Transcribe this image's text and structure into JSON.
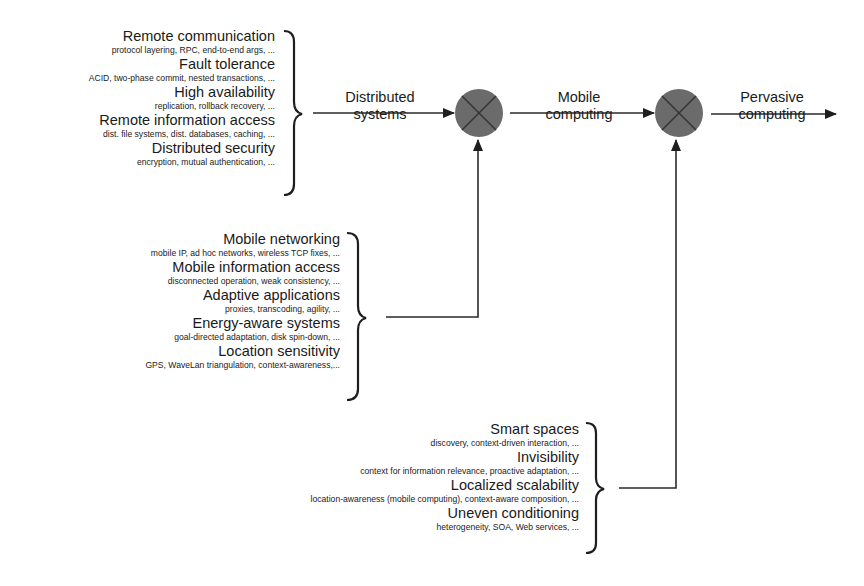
{
  "diagram": {
    "colors": {
      "line": "#2a2a2a",
      "node_fill": "#6b6b6b",
      "node_cross": "#333333",
      "text": "#1a1a1a"
    },
    "groups": [
      {
        "id": "distributed",
        "items": [
          {
            "title": "Remote communication",
            "detail": "protocol layering, RPC, end-to-end args, ..."
          },
          {
            "title": "Fault tolerance",
            "detail": "ACID, two-phase commit, nested transactions, ..."
          },
          {
            "title": "High availability",
            "detail": "replication, rollback recovery, ..."
          },
          {
            "title": "Remote information access",
            "detail": "dist. file systems, dist. databases, caching, ..."
          },
          {
            "title": "Distributed security",
            "detail": "encryption, mutual authentication, ..."
          }
        ]
      },
      {
        "id": "mobile",
        "items": [
          {
            "title": "Mobile networking",
            "detail": "mobile IP, ad hoc networks, wireless TCP fixes, ..."
          },
          {
            "title": "Mobile information access",
            "detail": "disconnected operation, weak consistency, ..."
          },
          {
            "title": "Adaptive applications",
            "detail": "proxies, transcoding, agility, ..."
          },
          {
            "title": "Energy-aware systems",
            "detail": "goal-directed adaptation, disk spin-down, ..."
          },
          {
            "title": "Location sensitivity",
            "detail": "GPS, WaveLan triangulation, context-awareness,..."
          }
        ]
      },
      {
        "id": "pervasive",
        "items": [
          {
            "title": "Smart spaces",
            "detail": "discovery, context-driven interaction, ..."
          },
          {
            "title": "Invisibility",
            "detail": "context for information relevance, proactive adaptation, ..."
          },
          {
            "title": "Localized scalability",
            "detail": "location-awareness (mobile computing), context-aware composition, ..."
          },
          {
            "title": "Uneven conditioning",
            "detail": "heterogeneity, SOA, Web services, ..."
          }
        ]
      }
    ],
    "flow_labels": {
      "distributed": [
        "Distributed",
        "systems"
      ],
      "mobile": [
        "Mobile",
        "computing"
      ],
      "pervasive": [
        "Pervasive",
        "computing"
      ]
    },
    "nodes": [
      {
        "id": "combine-1",
        "symbol": "circle-x"
      },
      {
        "id": "combine-2",
        "symbol": "circle-x"
      }
    ]
  }
}
